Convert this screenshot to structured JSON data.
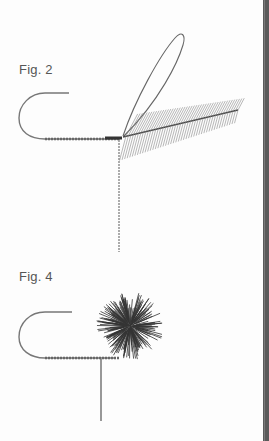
{
  "figures": [
    {
      "label": "Fig. 2"
    },
    {
      "label": "Fig. 4"
    }
  ]
}
